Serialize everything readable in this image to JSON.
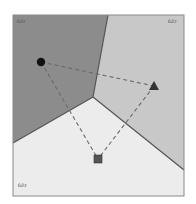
{
  "diagram": {
    "type": "voronoi-decision-regions",
    "frame": {
      "x": 13,
      "y": 15,
      "width": 171,
      "height": 181,
      "stroke": "#8a8a8a"
    },
    "junction": {
      "x": 93,
      "y": 97
    },
    "regions": [
      {
        "id": "omega1",
        "label": "ω₁",
        "fill": "#8c8c8c",
        "label_pos": {
          "x": 18,
          "y": 18
        }
      },
      {
        "id": "omega2",
        "label": "ω₂",
        "fill": "#c8c8c8",
        "label_pos": {
          "x": 168,
          "y": 18
        }
      },
      {
        "id": "omega3",
        "label": "ω₃",
        "fill": "#ececec",
        "label_pos": {
          "x": 18,
          "y": 182
        }
      }
    ],
    "boundaries": [
      {
        "from": {
          "x": 93,
          "y": 97
        },
        "to": {
          "x": 108,
          "y": 15
        }
      },
      {
        "from": {
          "x": 93,
          "y": 97
        },
        "to": {
          "x": 13,
          "y": 143
        }
      },
      {
        "from": {
          "x": 93,
          "y": 97
        },
        "to": {
          "x": 184,
          "y": 170
        }
      }
    ],
    "points": [
      {
        "id": "circle",
        "shape": "circle",
        "x": 41,
        "y": 62,
        "region": "omega1",
        "fill": "#111111"
      },
      {
        "id": "triangle",
        "shape": "triangle",
        "x": 154,
        "y": 86,
        "region": "omega2",
        "fill": "#333333"
      },
      {
        "id": "square",
        "shape": "square",
        "x": 98,
        "y": 159,
        "region": "omega3",
        "fill": "#555555"
      }
    ],
    "dashed_edges": [
      {
        "from": "circle",
        "to": "triangle"
      },
      {
        "from": "circle",
        "to": "square"
      },
      {
        "from": "triangle",
        "to": "square"
      }
    ],
    "dash_color": "#6a6a6a",
    "boundary_color": "#555555"
  }
}
